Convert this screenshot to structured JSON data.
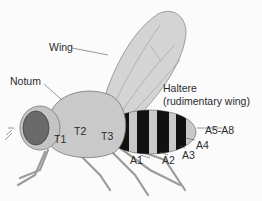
{
  "diagram": {
    "labels": {
      "wing": "Wing",
      "notum": "Notum",
      "haltere_line1": "Haltere",
      "haltere_line2": "(rudimentary wing)",
      "t1": "T1",
      "t2": "T2",
      "t3": "T3",
      "a1": "A1",
      "a2": "A2",
      "a3": "A3",
      "a4": "A4",
      "a5_a8": "A5-A8"
    },
    "colors": {
      "background": "#fbfbfb",
      "body": "#c9c9c9",
      "wing": "#d4d4d4",
      "eye": "#6a6a6a",
      "stripe": "#111111",
      "label": "#2b2b2b"
    }
  }
}
